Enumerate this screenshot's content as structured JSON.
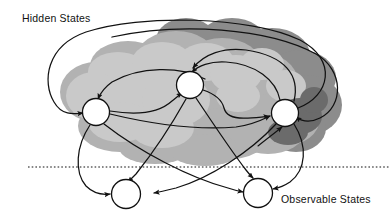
{
  "figure": {
    "type": "state-transition-diagram",
    "title_visible": false,
    "background_color": "#ffffff",
    "line_color": "#111111"
  },
  "labels": {
    "hidden_states": "Hidden States",
    "observable_states": "Observable States"
  },
  "label_positions": {
    "hidden_states": {
      "x": 22,
      "y": 22,
      "anchor": "start"
    },
    "observable_states": {
      "x": 281,
      "y": 203,
      "anchor": "start"
    }
  },
  "divider": {
    "name": "hidden-observable-divider",
    "style": "dotted",
    "y": 167,
    "x_start": 28,
    "x_end": 390,
    "color": "#111111"
  },
  "cloud": {
    "name": "hidden-states-cloud",
    "colors": {
      "light": "#c9c9c9",
      "mid": "#b2b2b2",
      "dark": "#8c8c8c",
      "deep": "#6b6b6b"
    }
  },
  "nodes": {
    "hidden": [
      {
        "id": "h1",
        "label": "",
        "cx": 96,
        "cy": 112,
        "r": 13.5,
        "name": "hidden-state-node-1"
      },
      {
        "id": "h2",
        "label": "",
        "cx": 190,
        "cy": 85,
        "r": 13.5,
        "name": "hidden-state-node-2"
      },
      {
        "id": "h3",
        "label": "",
        "cx": 285,
        "cy": 113,
        "r": 13.5,
        "name": "hidden-state-node-3"
      }
    ],
    "observable": [
      {
        "id": "o1",
        "label": "",
        "cx": 126,
        "cy": 194,
        "r": 14.5,
        "name": "observable-state-node-1"
      },
      {
        "id": "o2",
        "label": "",
        "cx": 258,
        "cy": 193,
        "r": 14.5,
        "name": "observable-state-node-2"
      }
    ]
  },
  "edges": [
    {
      "from": "h1",
      "to": "h2",
      "kind": "hidden-transition",
      "name": "edge-h1-h2"
    },
    {
      "from": "h2",
      "to": "h1",
      "kind": "hidden-transition",
      "name": "edge-h2-h1"
    },
    {
      "from": "h2",
      "to": "h3",
      "kind": "hidden-transition",
      "name": "edge-h2-h3"
    },
    {
      "from": "h3",
      "to": "h2",
      "kind": "hidden-transition",
      "name": "edge-h3-h2"
    },
    {
      "from": "h1",
      "to": "h3",
      "kind": "hidden-transition",
      "name": "edge-h1-h3"
    },
    {
      "from": "h3",
      "to": "h1",
      "kind": "hidden-transition-outer",
      "name": "edge-h3-h1"
    },
    {
      "from": "h2",
      "to": "h1",
      "kind": "hidden-transition-outer-top",
      "name": "edge-h2-h1-outer"
    },
    {
      "from": "h3",
      "to": "h2",
      "kind": "hidden-transition-outer-top",
      "name": "edge-h3-h2-outer"
    },
    {
      "from": "h1",
      "to": "o1",
      "kind": "emission",
      "name": "edge-h1-o1"
    },
    {
      "from": "h1",
      "to": "o2",
      "kind": "emission",
      "name": "edge-h1-o2"
    },
    {
      "from": "h2",
      "to": "o1",
      "kind": "emission",
      "name": "edge-h2-o1"
    },
    {
      "from": "h2",
      "to": "o2",
      "kind": "emission",
      "name": "edge-h2-o2"
    },
    {
      "from": "h3",
      "to": "o1",
      "kind": "emission",
      "name": "edge-h3-o1"
    },
    {
      "from": "h3",
      "to": "o2",
      "kind": "emission",
      "name": "edge-h3-o2"
    }
  ]
}
